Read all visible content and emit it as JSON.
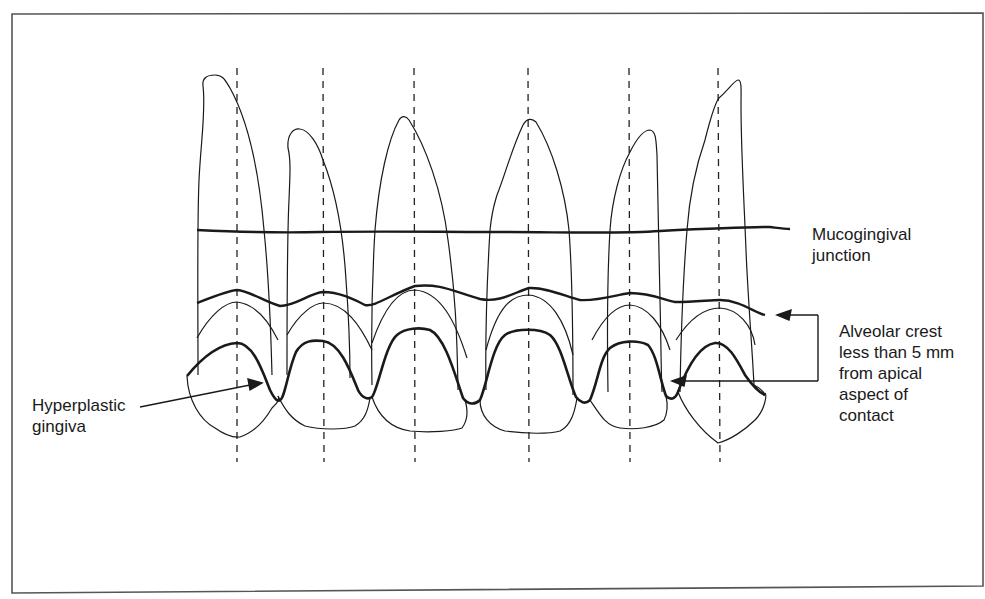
{
  "figure": {
    "labels": {
      "mucogingival": [
        "Mucogingival",
        "junction"
      ],
      "alveolar": [
        "Alveolar crest",
        "less than 5 mm",
        "from apical",
        "aspect of",
        "contact"
      ],
      "hyperplastic": [
        "Hyperplastic",
        "gingiva"
      ]
    },
    "colors": {
      "line": "#1a1a1a",
      "background": "#ffffff",
      "frame": "#555555"
    },
    "tooth_axes_x": [
      237,
      324,
      415,
      529,
      630,
      720
    ]
  }
}
